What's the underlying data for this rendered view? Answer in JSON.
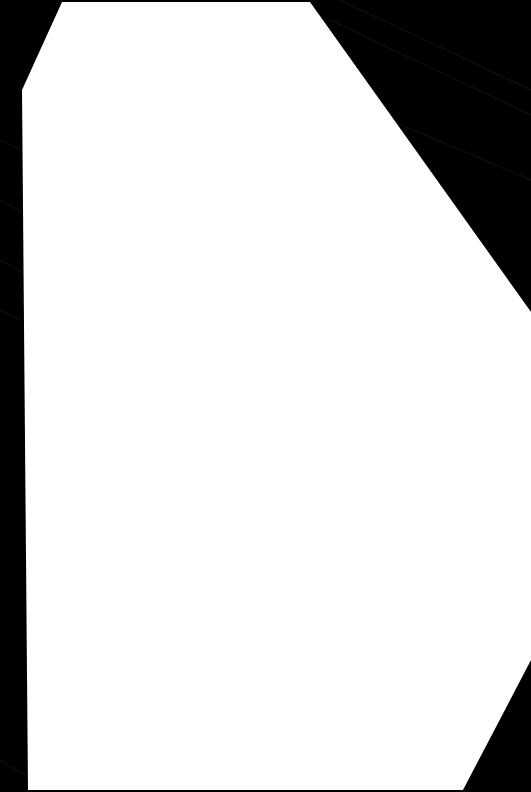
{
  "image": {
    "description": "Blank white sheet of paper photographed against a black background",
    "background_color": "#000000",
    "paper_color": "#ffffff",
    "visible_text": []
  }
}
